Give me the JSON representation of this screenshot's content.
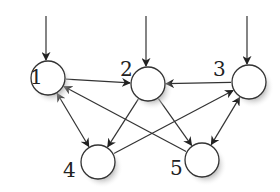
{
  "diagram": {
    "type": "directed-graph",
    "nodes": [
      {
        "id": "1",
        "label": "1",
        "cx": 48,
        "cy": 78,
        "lx": 30,
        "ly": 84
      },
      {
        "id": "2",
        "label": "2",
        "cx": 148,
        "cy": 84,
        "lx": 120,
        "ly": 76
      },
      {
        "id": "3",
        "label": "3",
        "cx": 249,
        "cy": 82,
        "lx": 213,
        "ly": 76
      },
      {
        "id": "4",
        "label": "4",
        "cx": 98,
        "cy": 162,
        "lx": 63,
        "ly": 177
      },
      {
        "id": "5",
        "label": "5",
        "cx": 202,
        "cy": 160,
        "lx": 170,
        "ly": 175
      }
    ],
    "inputs": [
      {
        "to": "1",
        "x": 46,
        "y1": 16,
        "y2": 60
      },
      {
        "to": "2",
        "x": 146,
        "y1": 16,
        "y2": 66
      },
      {
        "to": "3",
        "x": 247,
        "y1": 16,
        "y2": 64
      }
    ],
    "edges": [
      {
        "from": "1",
        "to": "2",
        "bidirectional": false
      },
      {
        "from": "3",
        "to": "2",
        "bidirectional": false
      },
      {
        "from": "4",
        "to": "3",
        "bidirectional": false
      },
      {
        "from": "5",
        "to": "1",
        "bidirectional": false
      },
      {
        "from": "2",
        "to": "4",
        "bidirectional": false
      },
      {
        "from": "2",
        "to": "5",
        "bidirectional": false
      },
      {
        "from": "1",
        "to": "4",
        "bidirectional": true
      },
      {
        "from": "3",
        "to": "5",
        "bidirectional": true
      }
    ],
    "node_radius": 17,
    "colors": {
      "stroke": "#333333",
      "fill": "#ffffff",
      "shadow": "#bbbbbb"
    }
  }
}
